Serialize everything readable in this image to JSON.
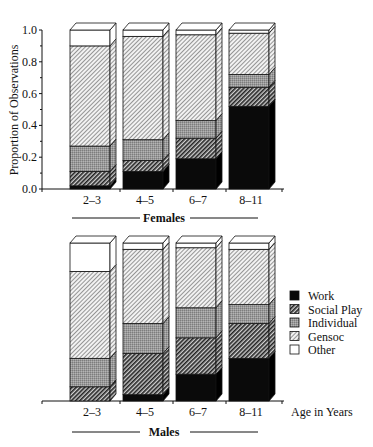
{
  "chart_data": [
    {
      "type": "bar",
      "stacked": true,
      "panel": "Females",
      "title": "Females",
      "xlabel": "",
      "ylabel": "Proportion of Observations",
      "ylim": [
        0,
        1.0
      ],
      "yticks": [
        "0.0",
        "0.2",
        "0.4",
        "0.6",
        "0.8",
        "1.0"
      ],
      "categories": [
        "2–3",
        "4–5",
        "6–7",
        "8–11"
      ],
      "series": [
        {
          "name": "Work",
          "values": [
            0.02,
            0.11,
            0.19,
            0.52
          ]
        },
        {
          "name": "Social Play",
          "values": [
            0.09,
            0.07,
            0.13,
            0.12
          ]
        },
        {
          "name": "Individual",
          "values": [
            0.16,
            0.13,
            0.11,
            0.08
          ]
        },
        {
          "name": "Gensoc",
          "values": [
            0.63,
            0.65,
            0.54,
            0.26
          ]
        },
        {
          "name": "Other",
          "values": [
            0.1,
            0.04,
            0.03,
            0.02
          ]
        }
      ]
    },
    {
      "type": "bar",
      "stacked": true,
      "panel": "Males",
      "title": "Males",
      "xlabel": "Age in Years",
      "ylabel": "",
      "ylim": [
        0,
        1.0
      ],
      "categories": [
        "2–3",
        "4–5",
        "6–7",
        "8–11"
      ],
      "series": [
        {
          "name": "Work",
          "values": [
            0.0,
            0.04,
            0.17,
            0.27
          ]
        },
        {
          "name": "Social Play",
          "values": [
            0.09,
            0.26,
            0.23,
            0.22
          ]
        },
        {
          "name": "Individual",
          "values": [
            0.18,
            0.19,
            0.19,
            0.12
          ]
        },
        {
          "name": "Gensoc",
          "values": [
            0.55,
            0.47,
            0.38,
            0.35
          ]
        },
        {
          "name": "Other",
          "values": [
            0.18,
            0.04,
            0.03,
            0.04
          ]
        }
      ]
    }
  ],
  "legend": {
    "position": "right of males panel",
    "items": [
      {
        "label": "Work",
        "pattern": "solid-black"
      },
      {
        "label": "Social Play",
        "pattern": "dense-hatch"
      },
      {
        "label": "Individual",
        "pattern": "gray-stipple"
      },
      {
        "label": "Gensoc",
        "pattern": "light-hatch"
      },
      {
        "label": "Other",
        "pattern": "white"
      }
    ]
  },
  "labels": {
    "ylabel": "Proportion of Observations",
    "females": "Females",
    "males": "Males",
    "age": "Age in Years"
  }
}
